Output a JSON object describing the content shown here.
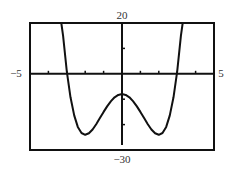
{
  "chart_data": {
    "type": "line",
    "title": "",
    "xlabel": "",
    "ylabel": "",
    "xlim": [
      -5,
      5
    ],
    "ylim": [
      -30,
      20
    ],
    "x_tick_step": 1,
    "y_tick_step": 10,
    "grid": false,
    "tick_labels": {
      "xmin": "−5",
      "xmax": "5",
      "ymax": "20",
      "ymin": "−30"
    },
    "series": [
      {
        "name": "f(x) = x^4 - 8x^2 - 8",
        "x": [
          -3.3,
          -3.2,
          -3.0,
          -2.8,
          -2.6,
          -2.4,
          -2.2,
          -2.0,
          -1.8,
          -1.6,
          -1.4,
          -1.2,
          -1.0,
          -0.8,
          -0.6,
          -0.4,
          -0.2,
          0.0,
          0.2,
          0.4,
          0.6,
          0.8,
          1.0,
          1.2,
          1.4,
          1.6,
          1.8,
          2.0,
          2.2,
          2.4,
          2.6,
          2.8,
          3.0,
          3.2,
          3.3
        ],
        "y": [
          20.0,
          14.97,
          1.0,
          -9.26,
          -16.39,
          -20.9,
          -23.29,
          -24.0,
          -23.42,
          -21.92,
          -19.84,
          -17.45,
          -15.0,
          -12.71,
          -10.75,
          -9.25,
          -8.32,
          -8.0,
          -8.32,
          -9.25,
          -10.75,
          -12.71,
          -15.0,
          -17.45,
          -19.84,
          -21.92,
          -23.42,
          -24.0,
          -23.29,
          -20.9,
          -16.39,
          -9.26,
          1.0,
          14.97,
          20.0
        ]
      }
    ],
    "color": "#111111"
  }
}
